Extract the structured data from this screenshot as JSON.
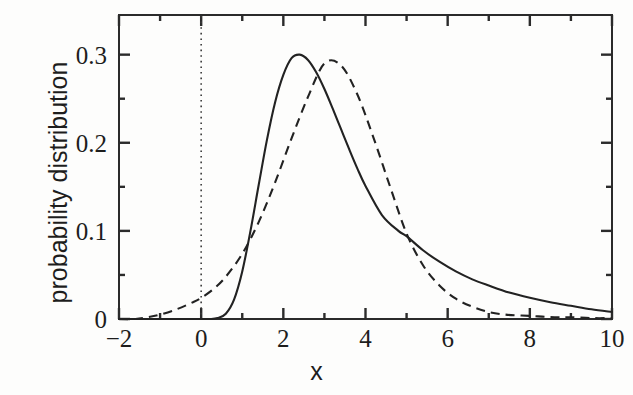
{
  "chart_data": {
    "type": "line",
    "title": "",
    "xlabel": "x",
    "ylabel": "probability distribution",
    "xlim": [
      -2,
      10
    ],
    "ylim": [
      0,
      0.345
    ],
    "grid": false,
    "legend": null,
    "x_ticks_major": [
      -2,
      0,
      2,
      4,
      6,
      8,
      10
    ],
    "x_tick_labels": [
      "−2",
      "0",
      "2",
      "4",
      "6",
      "8",
      "10"
    ],
    "x_ticks_minor": [
      -1,
      1,
      3,
      5,
      7,
      9
    ],
    "y_ticks_major": [
      0,
      0.1,
      0.2,
      0.3
    ],
    "y_tick_labels": [
      "0",
      "0.1",
      "0.2",
      "0.3"
    ],
    "y_ticks_minor": [
      0.05,
      0.15,
      0.25
    ],
    "annotations": [
      {
        "name": "zero-reference-line",
        "type": "vline",
        "x": 0,
        "style": "dotted"
      }
    ],
    "series": [
      {
        "name": "solid-curve",
        "style": "solid",
        "color": "#222222",
        "peak_x": 2.25,
        "peak_y": 0.3,
        "x": [
          -2.0,
          -1.5,
          -1.0,
          -0.5,
          0.0,
          0.2,
          0.4,
          0.6,
          0.8,
          1.0,
          1.2,
          1.4,
          1.6,
          1.8,
          2.0,
          2.2,
          2.4,
          2.6,
          2.8,
          3.0,
          3.2,
          3.4,
          3.6,
          3.8,
          4.0,
          4.4,
          4.8,
          5.0,
          5.4,
          5.8,
          6.2,
          6.6,
          7.0,
          7.5,
          8.0,
          8.5,
          9.0,
          9.5,
          10.0
        ],
        "y": [
          0.0,
          0.0,
          0.0,
          0.0,
          0.0,
          0.0,
          0.001,
          0.006,
          0.022,
          0.054,
          0.1,
          0.152,
          0.203,
          0.246,
          0.277,
          0.296,
          0.3,
          0.294,
          0.28,
          0.261,
          0.239,
          0.216,
          0.193,
          0.171,
          0.151,
          0.118,
          0.1,
          0.094,
          0.078,
          0.065,
          0.054,
          0.045,
          0.038,
          0.03,
          0.024,
          0.019,
          0.015,
          0.011,
          0.008
        ]
      },
      {
        "name": "dashed-curve",
        "style": "dashed",
        "color": "#222222",
        "peak_x": 3.0,
        "peak_y": 0.292,
        "x": [
          -2.0,
          -1.6,
          -1.3,
          -1.0,
          -0.6,
          -0.2,
          0.0,
          0.3,
          0.6,
          1.0,
          1.4,
          1.8,
          2.2,
          2.6,
          3.0,
          3.4,
          3.8,
          4.2,
          4.6,
          5.0,
          5.4,
          5.8,
          6.2,
          6.6,
          7.0,
          7.4,
          7.8,
          8.2,
          8.6,
          9.0,
          9.5,
          10.0
        ],
        "y": [
          0.0,
          0.0,
          0.002,
          0.005,
          0.011,
          0.019,
          0.024,
          0.034,
          0.048,
          0.074,
          0.11,
          0.155,
          0.205,
          0.252,
          0.29,
          0.288,
          0.255,
          0.205,
          0.15,
          0.097,
          0.061,
          0.038,
          0.023,
          0.014,
          0.008,
          0.005,
          0.004,
          0.003,
          0.002,
          0.002,
          0.001,
          0.001
        ]
      }
    ]
  }
}
